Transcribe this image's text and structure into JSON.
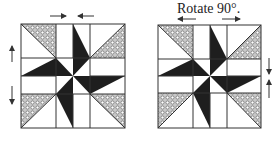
{
  "caption": "Rotate 90°.",
  "colors": {
    "dark": "#1e1e1e",
    "line": "#333333",
    "hatch_fill": "#bdbdbd",
    "background": "#ffffff"
  },
  "blocks": [
    {
      "name": "left-block",
      "arrows": [
        "top-pointing-inward",
        "left-up",
        "left-down"
      ]
    },
    {
      "name": "right-block-rotated",
      "arrows": [
        "top-pointing-outward",
        "right-down",
        "right-up"
      ]
    }
  ]
}
